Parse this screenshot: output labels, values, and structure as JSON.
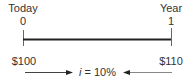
{
  "timeline": {
    "start": {
      "label": "Today",
      "period": "0",
      "amount": "$100"
    },
    "end": {
      "label": "Year",
      "period": "1",
      "amount": "$110"
    },
    "rate": {
      "symbol": "i",
      "equals": " = ",
      "value": "10%"
    }
  },
  "colors": {
    "line": "#222222",
    "arrow": "#444444",
    "text": "#333333"
  }
}
